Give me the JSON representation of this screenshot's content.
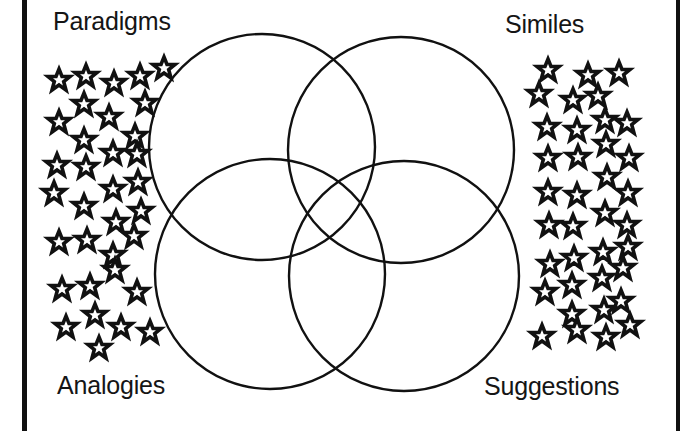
{
  "diagram": {
    "type": "venn",
    "sets": [
      {
        "id": "paradigms",
        "label": "Paradigms",
        "cx": 262,
        "cy": 147,
        "r": 113
      },
      {
        "id": "similes",
        "label": "Similes",
        "cx": 401,
        "cy": 150,
        "r": 113
      },
      {
        "id": "analogies",
        "label": "Analogies",
        "cx": 270,
        "cy": 274,
        "r": 115
      },
      {
        "id": "suggestions",
        "label": "Suggestions",
        "cx": 404,
        "cy": 276,
        "r": 115
      }
    ],
    "labels": {
      "top_left": "Paradigms",
      "top_right": "Similes",
      "bottom_left": "Analogies",
      "bottom_right": "Suggestions"
    },
    "colors": {
      "stroke": "#111111",
      "background": "#ffffff"
    },
    "stars_left": [
      [
        59,
        80
      ],
      [
        86,
        76
      ],
      [
        114,
        83
      ],
      [
        140,
        76
      ],
      [
        164,
        68
      ],
      [
        84,
        104
      ],
      [
        145,
        103
      ],
      [
        59,
        122
      ],
      [
        109,
        117
      ],
      [
        84,
        140
      ],
      [
        135,
        136
      ],
      [
        57,
        165
      ],
      [
        86,
        167
      ],
      [
        113,
        153
      ],
      [
        137,
        154
      ],
      [
        54,
        193
      ],
      [
        84,
        206
      ],
      [
        113,
        189
      ],
      [
        138,
        182
      ],
      [
        116,
        222
      ],
      [
        141,
        211
      ],
      [
        59,
        242
      ],
      [
        87,
        240
      ],
      [
        113,
        255
      ],
      [
        134,
        236
      ],
      [
        62,
        289
      ],
      [
        90,
        286
      ],
      [
        115,
        270
      ],
      [
        137,
        292
      ],
      [
        66,
        327
      ],
      [
        95,
        315
      ],
      [
        121,
        327
      ],
      [
        150,
        332
      ],
      [
        99,
        348
      ]
    ],
    "stars_right": [
      [
        548,
        70
      ],
      [
        588,
        75
      ],
      [
        619,
        73
      ],
      [
        539,
        94
      ],
      [
        573,
        100
      ],
      [
        598,
        96
      ],
      [
        547,
        127
      ],
      [
        577,
        130
      ],
      [
        605,
        120
      ],
      [
        627,
        123
      ],
      [
        548,
        158
      ],
      [
        578,
        157
      ],
      [
        606,
        144
      ],
      [
        629,
        158
      ],
      [
        548,
        192
      ],
      [
        577,
        195
      ],
      [
        607,
        177
      ],
      [
        628,
        193
      ],
      [
        549,
        225
      ],
      [
        573,
        226
      ],
      [
        605,
        213
      ],
      [
        627,
        225
      ],
      [
        550,
        264
      ],
      [
        574,
        258
      ],
      [
        603,
        252
      ],
      [
        628,
        247
      ],
      [
        545,
        292
      ],
      [
        572,
        285
      ],
      [
        602,
        278
      ],
      [
        623,
        268
      ],
      [
        572,
        314
      ],
      [
        604,
        310
      ],
      [
        621,
        301
      ],
      [
        542,
        336
      ],
      [
        577,
        330
      ],
      [
        606,
        337
      ],
      [
        630,
        325
      ]
    ]
  }
}
